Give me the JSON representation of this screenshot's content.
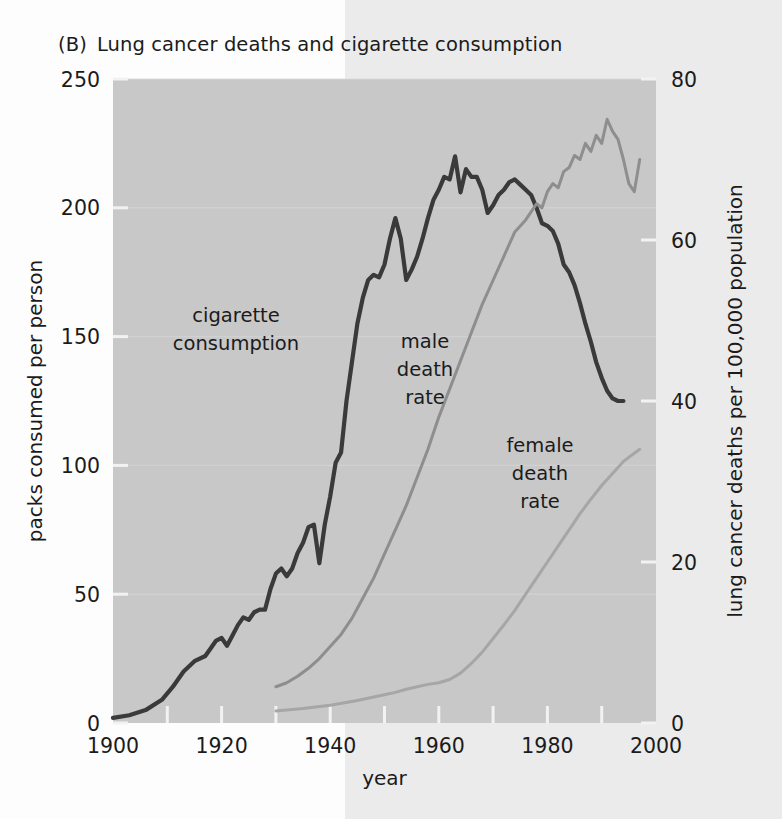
{
  "figure": {
    "panel_tag": "(B)",
    "title": "Lung cancer deaths and cigarette consumption"
  },
  "palette": {
    "page_background": "#fdfdfd",
    "page_tint": "#ebebeb",
    "plot_background": "#c8c8c8",
    "gridline": "#d9d9d9",
    "tick_mark": "#f2f2f2",
    "text": "#1b1b1b",
    "cigarette_line": "#3a3a3a",
    "male_line": "#8e8e8e",
    "female_line": "#a6a6a6"
  },
  "labels": {
    "cigarette": "cigarette\nconsumption",
    "cigarette_line1": "cigarette",
    "cigarette_line2": "consumption",
    "male_line1": "male",
    "male_line2": "death",
    "male_line3": "rate",
    "female_line1": "female",
    "female_line2": "death",
    "female_line3": "rate"
  },
  "chart_data": {
    "type": "line",
    "xlabel": "year",
    "ylabel": "packs consumed per person",
    "y2label": "lung cancer deaths per 100,000 population",
    "xlim": [
      1900,
      2000
    ],
    "ylim": [
      0,
      250
    ],
    "y2lim": [
      0,
      80
    ],
    "xticks": [
      1900,
      1920,
      1940,
      1960,
      1980,
      2000
    ],
    "xtick_labels": [
      "1900",
      "1920",
      "1940",
      "1960",
      "1980",
      "2000"
    ],
    "yticks": [
      0,
      50,
      100,
      150,
      200,
      250
    ],
    "ytick_labels": [
      "0",
      "50",
      "100",
      "150",
      "200",
      "250"
    ],
    "y2ticks": [
      0,
      20,
      40,
      60,
      80
    ],
    "y2tick_labels": [
      "0",
      "20",
      "40",
      "60",
      "80"
    ],
    "minor_xticks": [
      1910,
      1930,
      1950,
      1970,
      1990
    ],
    "grid": false,
    "legend": "inline-annotations",
    "legend_position": "inline",
    "series": [
      {
        "name": "cigarette consumption",
        "axis": "left",
        "units": "packs consumed per person",
        "color": "#3a3a3a",
        "annotation": "cigarette consumption",
        "points": [
          [
            1900,
            2
          ],
          [
            1903,
            3
          ],
          [
            1906,
            5
          ],
          [
            1909,
            9
          ],
          [
            1911,
            14
          ],
          [
            1913,
            20
          ],
          [
            1915,
            24
          ],
          [
            1917,
            26
          ],
          [
            1919,
            32
          ],
          [
            1920,
            33
          ],
          [
            1921,
            30
          ],
          [
            1922,
            34
          ],
          [
            1923,
            38
          ],
          [
            1924,
            41
          ],
          [
            1925,
            40
          ],
          [
            1926,
            43
          ],
          [
            1927,
            44
          ],
          [
            1928,
            44
          ],
          [
            1929,
            52
          ],
          [
            1930,
            58
          ],
          [
            1931,
            60
          ],
          [
            1932,
            57
          ],
          [
            1933,
            60
          ],
          [
            1934,
            66
          ],
          [
            1935,
            70
          ],
          [
            1936,
            76
          ],
          [
            1937,
            77
          ],
          [
            1938,
            62
          ],
          [
            1939,
            77
          ],
          [
            1940,
            88
          ],
          [
            1941,
            101
          ],
          [
            1942,
            105
          ],
          [
            1943,
            125
          ],
          [
            1944,
            140
          ],
          [
            1945,
            155
          ],
          [
            1946,
            165
          ],
          [
            1947,
            172
          ],
          [
            1948,
            174
          ],
          [
            1949,
            173
          ],
          [
            1950,
            178
          ],
          [
            1951,
            188
          ],
          [
            1952,
            196
          ],
          [
            1953,
            188
          ],
          [
            1954,
            172
          ],
          [
            1955,
            176
          ],
          [
            1956,
            181
          ],
          [
            1957,
            188
          ],
          [
            1958,
            196
          ],
          [
            1959,
            203
          ],
          [
            1960,
            207
          ],
          [
            1961,
            212
          ],
          [
            1962,
            211
          ],
          [
            1963,
            220
          ],
          [
            1964,
            206
          ],
          [
            1965,
            215
          ],
          [
            1966,
            212
          ],
          [
            1967,
            212
          ],
          [
            1968,
            207
          ],
          [
            1969,
            198
          ],
          [
            1970,
            201
          ],
          [
            1971,
            205
          ],
          [
            1972,
            207
          ],
          [
            1973,
            210
          ],
          [
            1974,
            211
          ],
          [
            1975,
            209
          ],
          [
            1976,
            207
          ],
          [
            1977,
            205
          ],
          [
            1978,
            200
          ],
          [
            1979,
            194
          ],
          [
            1980,
            193
          ],
          [
            1981,
            191
          ],
          [
            1982,
            186
          ],
          [
            1983,
            178
          ],
          [
            1984,
            175
          ],
          [
            1985,
            170
          ],
          [
            1986,
            163
          ],
          [
            1987,
            155
          ],
          [
            1988,
            148
          ],
          [
            1989,
            140
          ],
          [
            1990,
            134
          ],
          [
            1991,
            129
          ],
          [
            1992,
            126
          ],
          [
            1993,
            125
          ],
          [
            1994,
            125
          ]
        ]
      },
      {
        "name": "male death rate",
        "axis": "right",
        "units": "lung cancer deaths per 100,000 population",
        "color": "#8e8e8e",
        "annotation": "male death rate",
        "points": [
          [
            1930,
            4.5
          ],
          [
            1932,
            5.0
          ],
          [
            1934,
            5.8
          ],
          [
            1936,
            6.8
          ],
          [
            1938,
            8.0
          ],
          [
            1940,
            9.5
          ],
          [
            1942,
            11.0
          ],
          [
            1944,
            13.0
          ],
          [
            1946,
            15.5
          ],
          [
            1948,
            18.0
          ],
          [
            1950,
            21.0
          ],
          [
            1952,
            24.0
          ],
          [
            1954,
            27.0
          ],
          [
            1956,
            30.5
          ],
          [
            1958,
            34.0
          ],
          [
            1960,
            38.0
          ],
          [
            1962,
            41.5
          ],
          [
            1964,
            45.0
          ],
          [
            1966,
            48.5
          ],
          [
            1968,
            52.0
          ],
          [
            1970,
            55.0
          ],
          [
            1972,
            58.0
          ],
          [
            1974,
            61.0
          ],
          [
            1976,
            62.5
          ],
          [
            1977,
            63.5
          ],
          [
            1978,
            64.5
          ],
          [
            1979,
            64.0
          ],
          [
            1980,
            66.0
          ],
          [
            1981,
            67.0
          ],
          [
            1982,
            66.5
          ],
          [
            1983,
            68.5
          ],
          [
            1984,
            69.0
          ],
          [
            1985,
            70.5
          ],
          [
            1986,
            70.0
          ],
          [
            1987,
            72.0
          ],
          [
            1988,
            71.0
          ],
          [
            1989,
            73.0
          ],
          [
            1990,
            72.0
          ],
          [
            1991,
            75.0
          ],
          [
            1992,
            73.5
          ],
          [
            1993,
            72.5
          ],
          [
            1994,
            70.0
          ],
          [
            1995,
            67.0
          ],
          [
            1996,
            66.0
          ],
          [
            1997,
            70.0
          ]
        ]
      },
      {
        "name": "female death rate",
        "axis": "right",
        "units": "lung cancer deaths per 100,000 population",
        "color": "#a6a6a6",
        "annotation": "female death rate",
        "points": [
          [
            1930,
            1.5
          ],
          [
            1935,
            1.8
          ],
          [
            1940,
            2.2
          ],
          [
            1945,
            2.8
          ],
          [
            1950,
            3.5
          ],
          [
            1952,
            3.8
          ],
          [
            1954,
            4.2
          ],
          [
            1956,
            4.5
          ],
          [
            1958,
            4.8
          ],
          [
            1960,
            5.0
          ],
          [
            1962,
            5.4
          ],
          [
            1964,
            6.2
          ],
          [
            1966,
            7.4
          ],
          [
            1968,
            8.8
          ],
          [
            1970,
            10.5
          ],
          [
            1972,
            12.2
          ],
          [
            1974,
            14.0
          ],
          [
            1976,
            16.0
          ],
          [
            1978,
            18.0
          ],
          [
            1980,
            20.0
          ],
          [
            1982,
            22.0
          ],
          [
            1984,
            24.0
          ],
          [
            1986,
            26.0
          ],
          [
            1988,
            27.8
          ],
          [
            1990,
            29.5
          ],
          [
            1992,
            31.0
          ],
          [
            1994,
            32.5
          ],
          [
            1996,
            33.5
          ],
          [
            1997,
            34.0
          ]
        ]
      }
    ]
  }
}
